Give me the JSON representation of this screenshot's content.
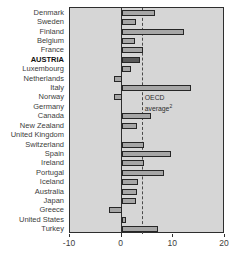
{
  "chart_data": {
    "type": "bar",
    "orientation": "horizontal",
    "title": "",
    "xlabel": "",
    "ylabel": "",
    "categories": [
      "Denmark",
      "Sweden",
      "Finland",
      "Belgium",
      "France",
      "AUSTRIA",
      "Luxembourg",
      "Netherlands",
      "Italy",
      "Norway",
      "Germany",
      "Canada",
      "New Zealand",
      "United Kingdom",
      "Switzerland",
      "Spain",
      "Ireland",
      "Portugal",
      "Iceland",
      "Australia",
      "Japan",
      "Greece",
      "United States",
      "Turkey"
    ],
    "values": [
      6.5,
      2.7,
      12.1,
      2.5,
      4.1,
      3.6,
      1.8,
      -1.5,
      13.4,
      -1.5,
      0,
      5.7,
      2.9,
      0,
      4.3,
      9.6,
      4.4,
      8.2,
      3.1,
      3.0,
      2.8,
      -2.5,
      0.8,
      7.1
    ],
    "bold_category": "AUSTRIA",
    "dark_bar_category": "AUSTRIA",
    "xlim": [
      -10,
      20
    ],
    "xticks": [
      "-10",
      "0",
      "10",
      "20"
    ],
    "grid": false,
    "legend": false,
    "reference_line": {
      "value": 3.9,
      "label_line1": "OECD",
      "label_line2": "average",
      "label_superscript": "2"
    }
  },
  "colors": {
    "page_bg": "#ffffff",
    "plot_bg": "#d6d6d6",
    "bar_fill": "#a6a6a6",
    "bar_border": "#262626",
    "dark_bar_fill": "#595959",
    "frame": "#2e2e2e",
    "zero_line": "#2e2e2e",
    "reference_line": "#4a4a4a",
    "text": "#3d3d3d"
  }
}
